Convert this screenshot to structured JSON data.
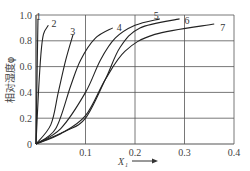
{
  "chart_data": {
    "type": "line",
    "title": "",
    "xlabel": "X₁",
    "ylabel": "相对湿度φ",
    "xlim": [
      0,
      0.4
    ],
    "ylim": [
      0,
      1.0
    ],
    "xticks": [
      "0.1",
      "0.2",
      "0.3",
      "0.4"
    ],
    "yticks": [
      "0",
      "0.2",
      "0.4",
      "0.6",
      "0.8",
      "1.0"
    ],
    "grid": true,
    "legend": "inline curve labels",
    "series": [
      {
        "name": "1",
        "points": [
          [
            0,
            0
          ],
          [
            0.002,
            0.5
          ],
          [
            0.004,
            0.97
          ]
        ]
      },
      {
        "name": "2",
        "points": [
          [
            0,
            0
          ],
          [
            0.005,
            0.4
          ],
          [
            0.01,
            0.7
          ],
          [
            0.015,
            0.85
          ],
          [
            0.025,
            0.92
          ]
        ]
      },
      {
        "name": "3",
        "points": [
          [
            0,
            0
          ],
          [
            0.03,
            0.15
          ],
          [
            0.045,
            0.4
          ],
          [
            0.06,
            0.65
          ],
          [
            0.075,
            0.85
          ]
        ]
      },
      {
        "name": "4",
        "points": [
          [
            0,
            0
          ],
          [
            0.04,
            0.12
          ],
          [
            0.07,
            0.45
          ],
          [
            0.09,
            0.65
          ],
          [
            0.12,
            0.82
          ],
          [
            0.155,
            0.9
          ]
        ]
      },
      {
        "name": "5",
        "points": [
          [
            0,
            0
          ],
          [
            0.05,
            0.12
          ],
          [
            0.1,
            0.4
          ],
          [
            0.13,
            0.65
          ],
          [
            0.16,
            0.82
          ],
          [
            0.2,
            0.92
          ],
          [
            0.25,
            0.97
          ]
        ]
      },
      {
        "name": "6",
        "points": [
          [
            0,
            0
          ],
          [
            0.06,
            0.1
          ],
          [
            0.1,
            0.2
          ],
          [
            0.14,
            0.5
          ],
          [
            0.17,
            0.75
          ],
          [
            0.21,
            0.9
          ],
          [
            0.29,
            0.97
          ]
        ]
      },
      {
        "name": "7",
        "points": [
          [
            0,
            0
          ],
          [
            0.05,
            0.08
          ],
          [
            0.1,
            0.22
          ],
          [
            0.14,
            0.5
          ],
          [
            0.18,
            0.72
          ],
          [
            0.24,
            0.85
          ],
          [
            0.36,
            0.93
          ]
        ]
      }
    ]
  },
  "axis": {
    "origin_label": "0",
    "x_label": "X",
    "x_label_sub": "1",
    "y_label": "相对湿度φ"
  }
}
